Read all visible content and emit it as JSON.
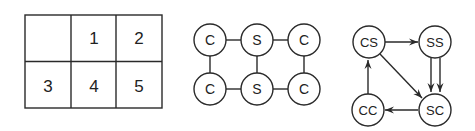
{
  "grid": {
    "rows": 2,
    "cols": 3,
    "cells": [
      [
        "",
        "1",
        "2"
      ],
      [
        "3",
        "4",
        "5"
      ]
    ]
  },
  "lattice": {
    "nodes": [
      {
        "id": "n1",
        "label": "C"
      },
      {
        "id": "n2",
        "label": "S"
      },
      {
        "id": "n3",
        "label": "C"
      },
      {
        "id": "n4",
        "label": "C"
      },
      {
        "id": "n5",
        "label": "S"
      },
      {
        "id": "n6",
        "label": "C"
      }
    ],
    "edges": [
      [
        "n1",
        "n2"
      ],
      [
        "n2",
        "n3"
      ],
      [
        "n4",
        "n5"
      ],
      [
        "n5",
        "n6"
      ],
      [
        "n1",
        "n4"
      ],
      [
        "n2",
        "n5"
      ],
      [
        "n3",
        "n6"
      ]
    ]
  },
  "transition_graph": {
    "nodes": [
      {
        "id": "cs",
        "label": "CS"
      },
      {
        "id": "ss",
        "label": "SS"
      },
      {
        "id": "cc",
        "label": "CC"
      },
      {
        "id": "sc",
        "label": "SC"
      }
    ],
    "edges": [
      {
        "from": "cs",
        "to": "ss",
        "count": 1
      },
      {
        "from": "ss",
        "to": "sc",
        "count": 2
      },
      {
        "from": "cs",
        "to": "sc",
        "count": 1
      },
      {
        "from": "sc",
        "to": "cc",
        "count": 1
      },
      {
        "from": "cc",
        "to": "cs",
        "count": 1
      }
    ]
  },
  "colors": {
    "stroke": "#2a2a2a",
    "background": "#ffffff"
  }
}
